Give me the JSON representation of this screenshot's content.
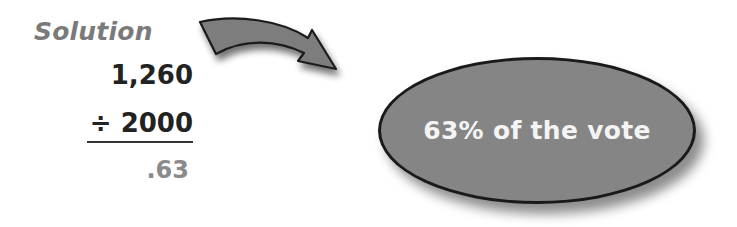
{
  "heading": {
    "label": "Solution"
  },
  "calculation": {
    "dividend": "1,260",
    "operator": "÷",
    "divisor": "2000",
    "divisor_line": "÷ 2000",
    "quotient": ".63"
  },
  "result": {
    "text": "63% of the vote"
  },
  "icons": {
    "arrow": "curved-arrow-right-icon"
  },
  "colors": {
    "heading": "#7a7a7a",
    "numbers": "#222222",
    "quotient": "#8a8a8a",
    "ellipse_fill": "#858585",
    "ellipse_border": "#1a1a1a",
    "arrow_fill": "#7d7d7d",
    "ellipse_text": "#f4f4f4"
  }
}
